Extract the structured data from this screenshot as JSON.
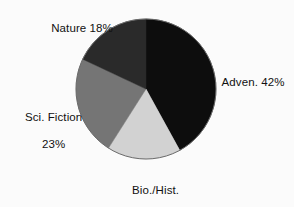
{
  "chart_data": {
    "type": "pie",
    "title": "",
    "subtitle": "",
    "xlabel": "",
    "ylabel": "",
    "legend_position": "none",
    "grid": false,
    "unit": "%",
    "start_angle_deg": 0,
    "direction": "clockwise",
    "categories": [
      "Adven.",
      "Bio./Hist.",
      "Sci. Fiction",
      "Nature"
    ],
    "values": [
      42,
      17,
      23,
      18
    ],
    "slices": [
      {
        "name": "Adven.",
        "value": 42,
        "label": "Adven. 42%",
        "label_line1": "Adven. 42%",
        "label_line2": "",
        "color": "#0d0d0d",
        "start_deg": 0,
        "end_deg": 151.2
      },
      {
        "name": "Bio./Hist.",
        "value": 17,
        "label": "Bio./Hist. 17%",
        "label_line1": "Bio./Hist.",
        "label_line2": "17%",
        "color": "#d2d2d2",
        "start_deg": 151.2,
        "end_deg": 212.4
      },
      {
        "name": "Sci. Fiction",
        "value": 23,
        "label": "Sci. Fiction 23%",
        "label_line1": "Sci. Fiction",
        "label_line2": "23%",
        "color": "#757575",
        "start_deg": 212.4,
        "end_deg": 295.2
      },
      {
        "name": "Nature",
        "value": 18,
        "label": "Nature 18%",
        "label_line1": "Nature 18%",
        "label_line2": "",
        "color": "#2a2a2a",
        "start_deg": 295.2,
        "end_deg": 360
      }
    ],
    "geometry": {
      "center_x": 146,
      "center_y": 89,
      "radius": 70
    },
    "colors": {
      "background": "#fbfbfb",
      "text": "#111111",
      "outline": "#6b6b6b"
    }
  }
}
